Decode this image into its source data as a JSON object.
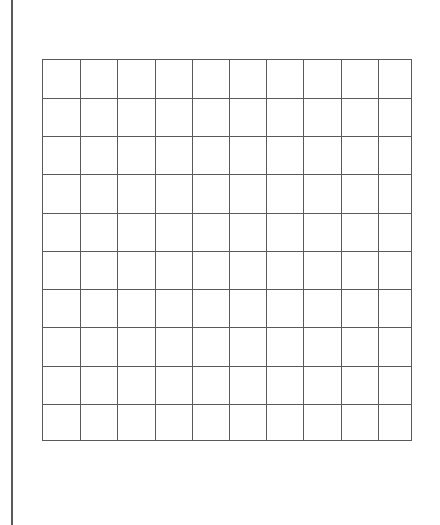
{
  "page": {
    "background": "#ffffff",
    "line_color": "#5a5a5a"
  },
  "grid": {
    "columns": 10,
    "rows": 10,
    "vertical_lines_x": [
      80,
      117,
      155,
      192,
      229,
      266,
      303,
      341,
      378
    ],
    "horizontal_lines_y": [
      98,
      136,
      174,
      213,
      251,
      289,
      327,
      366,
      404
    ]
  }
}
